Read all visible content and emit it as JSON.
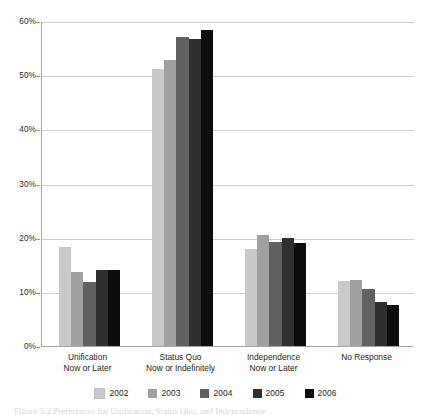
{
  "chart_data": {
    "type": "bar",
    "title": "",
    "subtitle": "",
    "xlabel": "",
    "ylabel": "",
    "ylim": [
      0,
      60
    ],
    "ytick_values": [
      0,
      10,
      20,
      30,
      40,
      50,
      60
    ],
    "ytick_labels": [
      "0%",
      "10%",
      "20%",
      "30%",
      "40%",
      "50%",
      "60%"
    ],
    "grid": true,
    "legend_position": "bottom",
    "categories": [
      "Unification\nNow or Later",
      "Status Quo\nNow or Indefinitely",
      "Independence\nNow or Later",
      "No Response"
    ],
    "category_lines": [
      [
        "Unification",
        "Now or Later"
      ],
      [
        "Status Quo",
        "Now or Indefinitely"
      ],
      [
        "Independence",
        "Now or Later"
      ],
      [
        "No Response",
        ""
      ]
    ],
    "series": [
      {
        "name": "2002",
        "color": "#c9c9c9",
        "values": [
          18.3,
          51.1,
          18.0,
          12.0
        ]
      },
      {
        "name": "2003",
        "color": "#a0a0a0",
        "values": [
          13.6,
          52.8,
          20.5,
          12.2
        ]
      },
      {
        "name": "2004",
        "color": "#616161",
        "values": [
          11.9,
          57.0,
          19.2,
          10.6
        ]
      },
      {
        "name": "2005",
        "color": "#2f2f2f",
        "values": [
          14.0,
          56.6,
          19.9,
          8.2
        ]
      },
      {
        "name": "2006",
        "color": "#0d0d0d",
        "values": [
          14.1,
          58.3,
          19.0,
          7.6
        ]
      }
    ]
  },
  "legend": {
    "items": [
      {
        "label": "2002",
        "color": "#c9c9c9"
      },
      {
        "label": "2003",
        "color": "#a0a0a0"
      },
      {
        "label": "2004",
        "color": "#616161"
      },
      {
        "label": "2005",
        "color": "#2f2f2f"
      },
      {
        "label": "2006",
        "color": "#0d0d0d"
      }
    ]
  },
  "caption": {
    "text": "Figure 3.2  Preferences for Unification, Status Quo, and Independence"
  },
  "colors": {
    "gridline": "#cfcfcf",
    "axis": "#a6a6a6",
    "text": "#231f20",
    "background": "#ffffff"
  }
}
